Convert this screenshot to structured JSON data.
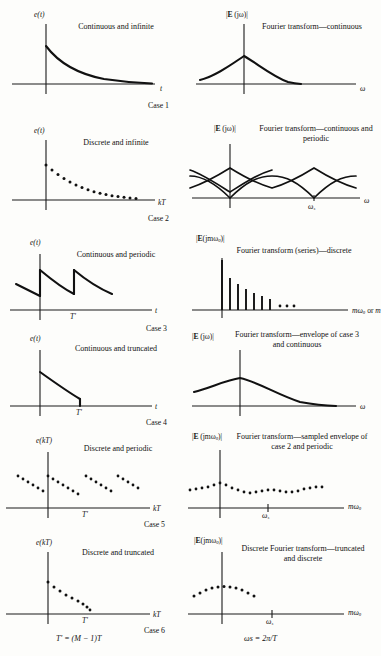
{
  "figure": {
    "background_color": "#fdfdfb",
    "ink_color": "#111111"
  },
  "cases": [
    {
      "id": "case-1",
      "caption": "Case 1",
      "left": {
        "y_label": "e(t)",
        "x_label": "t",
        "description": "Continuous and infinite",
        "signal_type": "continuous-decaying-exponential"
      },
      "right": {
        "y_label": "|E(jω)|",
        "x_label": "ω",
        "description": "Fourier transform—continuous",
        "signal_type": "continuous-single-lobe"
      }
    },
    {
      "id": "case-2",
      "caption": "Case 2",
      "left": {
        "y_label": "e(t)",
        "x_label": "kT",
        "description": "Discrete and infinite",
        "signal_type": "sampled-decaying-exponential"
      },
      "right": {
        "y_label": "|E(jω)|",
        "x_label": "ω",
        "description": "Fourier transform—continuous and periodic",
        "marker_label": "ωs",
        "signal_type": "periodic-overlapping-aliased-lobes"
      }
    },
    {
      "id": "case-3",
      "caption": "Case 3",
      "left": {
        "y_label": "e(t)",
        "x_label": "t",
        "period_label": "T'",
        "description": "Continuous and periodic",
        "signal_type": "periodic-sawtooth-exponential"
      },
      "right": {
        "y_label": "|E(jmω0)|",
        "x_label": "mω0 or m",
        "description": "Fourier transform (series)—discrete",
        "signal_type": "discrete-line-spectrum",
        "stem_values": [
          100,
          74,
          58,
          46,
          37,
          30,
          24
        ],
        "ellipsis": "..."
      }
    },
    {
      "id": "case-4",
      "caption": "Case 4",
      "left": {
        "y_label": "e(t)",
        "x_label": "t",
        "period_label": "T'",
        "description": "Continuous and truncated",
        "signal_type": "truncated-decaying-exponential"
      },
      "right": {
        "y_label": "|E(jω)|",
        "x_label": "ω",
        "description": "Fourier transform—envelope of case 3 and continuous",
        "signal_type": "continuous-single-lobe"
      }
    },
    {
      "id": "case-5",
      "caption": "Case 5",
      "left": {
        "y_label": "e(kT)",
        "x_label": "kT",
        "period_label": "T'",
        "description": "Discrete and periodic",
        "signal_type": "periodic-sampled-sawtooth"
      },
      "right": {
        "y_label": "|E(jmω0)|",
        "x_label": "mω0",
        "description": "Fourier transform—sampled envelope of case 2 and periodic",
        "marker_label": "ωs",
        "signal_type": "sampled-periodic-spectrum"
      }
    },
    {
      "id": "case-6",
      "caption": "Case 6",
      "left": {
        "y_label": "e(kT)",
        "x_label": "kT",
        "period_label": "T'",
        "description": "Discrete and truncated",
        "signal_type": "truncated-sampled-exponential"
      },
      "right": {
        "y_label": "|E(jmω0)|",
        "x_label": "mω0",
        "description": "Discrete Fourier transform—truncated and discrete",
        "marker_label": "ωs",
        "signal_type": "truncated-sampled-spectrum"
      }
    }
  ],
  "footnotes": {
    "left_formula": "T' = (M − 1)T",
    "right_formula": "ωs = 2π/T"
  }
}
